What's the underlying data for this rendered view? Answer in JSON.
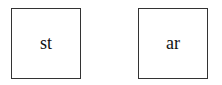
{
  "boxes": [
    {
      "label": "st"
    },
    {
      "label": "ar"
    }
  ]
}
